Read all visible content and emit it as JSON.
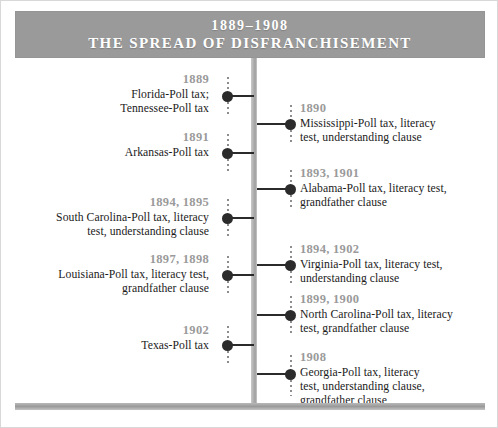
{
  "header": {
    "date_range": "1889–1908",
    "title": "THE SPREAD OF DISFRANCHISEMENT"
  },
  "colors": {
    "banner": "#9a9a9a",
    "year_text": "#9a9a9a",
    "body_text": "#1b1b1b",
    "dot": "#2b2b2b",
    "spine": "#b4b4b4",
    "banner_text": "#ffffff"
  },
  "timeline": {
    "left_entries": [
      {
        "year": "1889",
        "lines": [
          "Florida-Poll tax;",
          "Tennessee-Poll tax"
        ]
      },
      {
        "year": "1891",
        "lines": [
          "Arkansas-Poll tax"
        ]
      },
      {
        "year": "1894, 1895",
        "lines": [
          "South Carolina-Poll tax, literacy",
          "test, understanding clause"
        ]
      },
      {
        "year": "1897, 1898",
        "lines": [
          "Louisiana-Poll tax, literacy test,",
          "grandfather clause"
        ]
      },
      {
        "year": "1902",
        "lines": [
          "Texas-Poll tax"
        ]
      }
    ],
    "right_entries": [
      {
        "year": "1890",
        "lines": [
          "Mississippi-Poll tax, literacy",
          "test, understanding clause"
        ]
      },
      {
        "year": "1893, 1901",
        "lines": [
          "Alabama-Poll tax, literacy test,",
          "grandfather clause"
        ]
      },
      {
        "year": "1894, 1902",
        "lines": [
          "Virginia-Poll tax, literacy test,",
          "understanding clause"
        ]
      },
      {
        "year": "1899, 1900",
        "lines": [
          "North Carolina-Poll tax, literacy",
          "test, grandfather clause"
        ]
      },
      {
        "year": "1908",
        "lines": [
          "Georgia-Poll tax, literacy",
          "test, understanding clause,",
          "grandfather clause"
        ]
      }
    ]
  }
}
